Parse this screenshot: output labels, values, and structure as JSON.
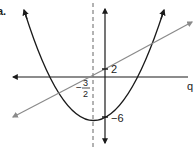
{
  "figure": {
    "part_label": "a.",
    "x_axis_label": "q",
    "y_intercept_line_label": "2",
    "y_intercept_parabola_label": "−6",
    "axis_of_symmetry_label_num": "3",
    "axis_of_symmetry_label_den": "2",
    "axis_of_symmetry_label_sign": "−",
    "colors": {
      "axes": "#1a1a1a",
      "parabola": "#1a1a1a",
      "line": "#8a8a8a",
      "dashed": "#666666"
    }
  }
}
